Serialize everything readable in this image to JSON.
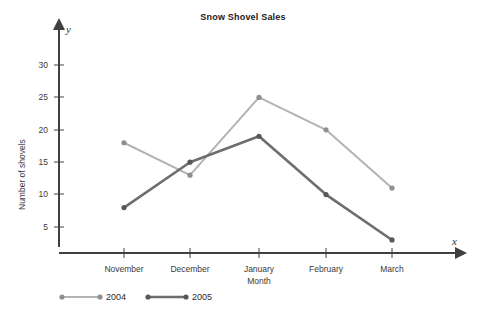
{
  "chart_data": {
    "type": "line",
    "title": "Snow Shovel Sales",
    "xlabel": "Month",
    "ylabel": "Number of shovels",
    "x_axis_letter": "x",
    "y_axis_letter": "y",
    "categories": [
      "November",
      "December",
      "January",
      "February",
      "March"
    ],
    "yticks": [
      5,
      10,
      15,
      20,
      25,
      30
    ],
    "ylim": [
      0,
      33
    ],
    "grid": false,
    "legend_position": "bottom-left",
    "series": [
      {
        "name": "2004",
        "values": [
          18,
          13,
          25,
          20,
          11
        ],
        "color": "#b3b3b3"
      },
      {
        "name": "2005",
        "values": [
          8,
          15,
          19,
          10,
          3
        ],
        "color": "#6e6e6e"
      }
    ]
  },
  "legend": {
    "items": [
      {
        "label": "2004"
      },
      {
        "label": "2005"
      }
    ]
  },
  "colors": {
    "series_2004": "#b3b3b3",
    "series_2005": "#6e6e6e",
    "axis": "#404040",
    "text": "#2b2b2b"
  }
}
